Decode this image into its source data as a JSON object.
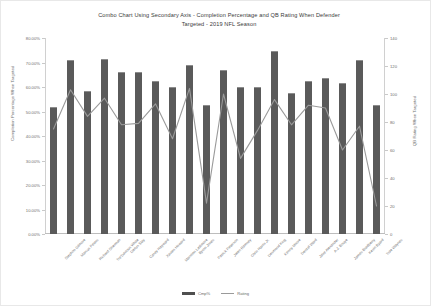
{
  "chart_data": {
    "type": "bar",
    "title": "Combo Chart Using Secondary Axis - Completion Percentage and QB Rating When Defender Targeted - 2019 NFL Season",
    "title_line1": "Combo Chart Using Secondary Axis - Completion Percentage and QB Rating When Defender",
    "title_line2": "Targeted - 2019 NFL Season",
    "xlabel": "",
    "ylabel": "Completion Percentage When Targeted",
    "ylabel_secondary": "QB Rating When Targeted",
    "ylim": [
      0,
      80
    ],
    "ylim_secondary": [
      0,
      140
    ],
    "grid": false,
    "legend_position": "bottom",
    "categories": [
      "Stephon Gilmore",
      "Marcus Peters",
      "Richard Sherman",
      "Tre'Davious White",
      "Darius Slay",
      "Casey Hayward",
      "Xavien Howard",
      "Marshon Lattimore",
      "Byron Jones",
      "Patrick Peterson",
      "Jalen Ramsey",
      "Chris Harris Jr.",
      "Desmond King",
      "Kenny Moore",
      "Denzel Ward",
      "Jaire Alexander",
      "A.J. Bouye",
      "James Bradberry",
      "Kevin Byard",
      "Trae Waynes"
    ],
    "y_ticks": [
      "0.00%",
      "10.00%",
      "20.00%",
      "30.00%",
      "40.00%",
      "50.00%",
      "60.00%",
      "70.00%",
      "80.00%"
    ],
    "y_ticks_secondary": [
      "0",
      "20",
      "40",
      "60",
      "80",
      "100",
      "120",
      "140"
    ],
    "series": [
      {
        "name": "Cmp%",
        "type": "bar",
        "axis": "primary",
        "values": [
          52.0,
          71.0,
          58.5,
          71.5,
          66.0,
          66.0,
          62.5,
          60.0,
          69.0,
          52.5,
          67.0,
          60.0,
          60.0,
          74.5,
          57.5,
          62.5,
          63.5,
          61.5,
          71.0,
          52.5
        ]
      },
      {
        "name": "Rating",
        "type": "line",
        "axis": "secondary",
        "values": [
          75.0,
          103.0,
          84.0,
          97.0,
          78.0,
          79.0,
          93.0,
          68.0,
          104.0,
          22.0,
          100.0,
          54.0,
          74.0,
          96.0,
          78.0,
          92.0,
          90.0,
          60.0,
          77.0,
          20.0
        ]
      }
    ],
    "colors": {
      "bar": "#5a5a5a",
      "bar_edge": "#8d8d8d",
      "line": "#9a9a9a",
      "text": "#6e6e6e",
      "title": "#3a3a3a",
      "axis": "#c9c9c9",
      "background": "#ffffff"
    }
  },
  "legend": {
    "items": [
      {
        "label": "Cmp%"
      },
      {
        "label": "Rating"
      }
    ]
  }
}
